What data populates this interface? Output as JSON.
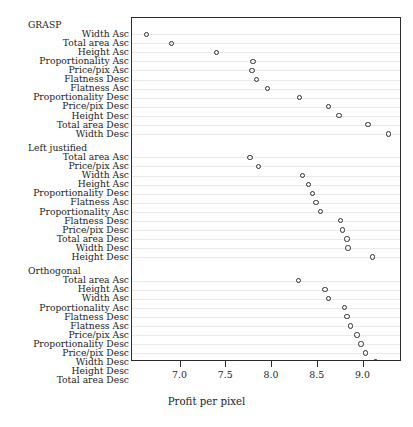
{
  "chart_data": {
    "type": "scatter",
    "title": "",
    "xlabel": "Profit per pixel",
    "ylabel": "",
    "xlim": [
      6.47,
      9.42
    ],
    "xticks": [
      7.0,
      7.5,
      8.0,
      8.5,
      9.0
    ],
    "xticklabels": [
      "7.0",
      "7.5",
      "8.0",
      "8.5",
      "9.0"
    ],
    "grid": "horizontal",
    "legend": "none",
    "marker": "open-circle",
    "groups": [
      {
        "name": "GRASP",
        "categories": [
          "Width Asc",
          "Total area Asc",
          "Height Asc",
          "Proportionality Asc",
          "Price/pix Asc",
          "Flatness Desc",
          "Flatness Asc",
          "Proportionality Desc",
          "Price/pix Desc",
          "Height Desc",
          "Total area Desc",
          "Width Desc"
        ],
        "values": [
          6.63,
          6.9,
          7.39,
          7.79,
          7.78,
          7.83,
          7.95,
          8.3,
          8.62,
          8.73,
          9.05,
          9.27
        ]
      },
      {
        "name": "Left justified",
        "categories": [
          "Total area Asc",
          "Price/pix Asc",
          "Width Asc",
          "Height Asc",
          "Proportionality Desc",
          "Flatness Asc",
          "Proportionality Asc",
          "Flatness Desc",
          "Price/pix Desc",
          "Total area Desc",
          "Width Desc",
          "Height Desc"
        ],
        "values": [
          7.76,
          7.85,
          8.33,
          8.4,
          8.44,
          8.48,
          8.53,
          8.75,
          8.77,
          8.82,
          8.83,
          9.1
        ]
      },
      {
        "name": "Orthogonal",
        "categories": [
          "Total area Asc",
          "Height Asc",
          "Width Asc",
          "Proportionality Asc",
          "Flatness Desc",
          "Flatness Asc",
          "Price/pix Asc",
          "Proportionality Desc",
          "Price/pix Desc",
          "Width Desc",
          "Height Desc",
          "Total area Desc"
        ],
        "values": [
          8.29,
          8.58,
          8.62,
          8.79,
          8.82,
          8.86,
          8.93,
          8.97,
          9.02,
          9.13,
          9.17,
          9.19
        ]
      }
    ]
  }
}
